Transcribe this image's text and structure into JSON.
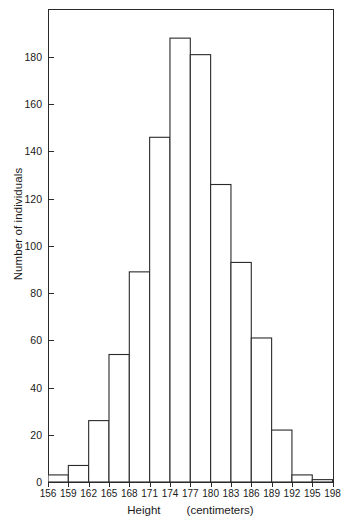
{
  "chart_data": {
    "type": "bar",
    "title": "",
    "subtitle": "",
    "xlabel_main": "Height",
    "xlabel_unit": "(centimeters)",
    "xlabel": "Height    (centimeters)",
    "ylabel": "Number of individuals",
    "grid": false,
    "legend": "none",
    "bin_width": 3,
    "xlim": [
      156,
      198
    ],
    "ylim": [
      0,
      198
    ],
    "ytick_values": [
      0,
      20,
      40,
      60,
      80,
      100,
      120,
      140,
      160,
      180
    ],
    "ytick_labels": [
      "0",
      "20",
      "40",
      "60",
      "80",
      "100",
      "120",
      "140",
      "160",
      "180"
    ],
    "xtick_values": [
      156,
      159,
      162,
      165,
      168,
      171,
      174,
      177,
      180,
      183,
      186,
      189,
      192,
      195,
      198
    ],
    "xtick_labels": [
      "156",
      "159",
      "162",
      "165",
      "168",
      "171",
      "174",
      "177",
      "180",
      "183",
      "186",
      "189",
      "192",
      "195",
      "198"
    ],
    "bin_edges": [
      156,
      159,
      162,
      165,
      168,
      171,
      174,
      177,
      180,
      183,
      186,
      189,
      192,
      195,
      198
    ],
    "categories": [
      "156-159",
      "159-162",
      "162-165",
      "165-168",
      "168-171",
      "171-174",
      "174-177",
      "177-180",
      "180-183",
      "183-186",
      "186-189",
      "189-192",
      "192-195",
      "195-198"
    ],
    "values": [
      3,
      7,
      26,
      54,
      89,
      146,
      188,
      181,
      126,
      93,
      61,
      22,
      3,
      1
    ],
    "colors": {
      "bar_fill": "#ffffff",
      "bar_stroke": "#2a2a2a",
      "axis": "#2a2a2a",
      "text": "#1a1a1a",
      "background": "#ffffff"
    }
  }
}
